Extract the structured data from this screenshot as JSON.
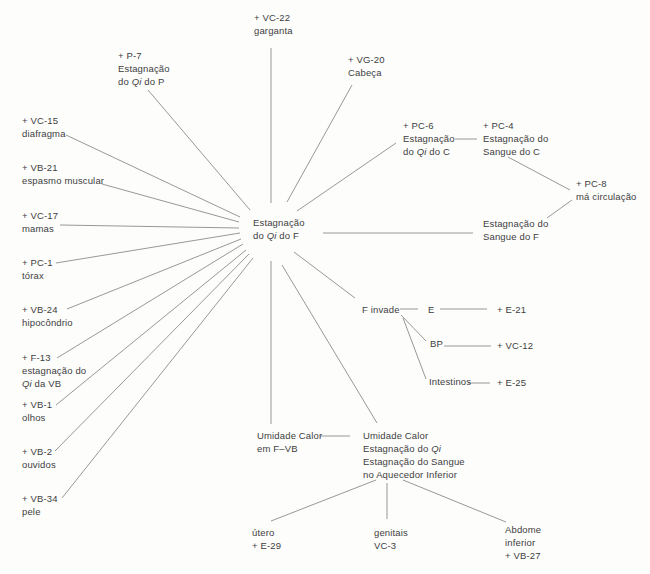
{
  "canvas": {
    "width": 650,
    "height": 574,
    "background_color": "#fdfdfc",
    "text_color": "#3e3e3e",
    "line_color": "#8c8c8c"
  },
  "nodes": [
    {
      "id": "vc22",
      "x": 254,
      "y": 12,
      "lines": [
        "+ VC-22",
        "garganta"
      ]
    },
    {
      "id": "p7",
      "x": 118,
      "y": 50,
      "lines": [
        "+ P-7",
        "Estagnação",
        "do Qi do P"
      ]
    },
    {
      "id": "vg20",
      "x": 348,
      "y": 54,
      "lines": [
        "+ VG-20",
        "Cabeça"
      ]
    },
    {
      "id": "pc6",
      "x": 403,
      "y": 120,
      "lines": [
        "+ PC-6",
        "Estagnação",
        "do Qi do C"
      ]
    },
    {
      "id": "pc4",
      "x": 483,
      "y": 120,
      "lines": [
        "+ PC-4",
        "Estagnação do",
        "Sangue do C"
      ]
    },
    {
      "id": "pc8",
      "x": 576,
      "y": 178,
      "lines": [
        "+ PC-8",
        "má circulação"
      ]
    },
    {
      "id": "sangue-f",
      "x": 483,
      "y": 218,
      "lines": [
        "Estagnação do",
        "Sangue do F"
      ]
    },
    {
      "id": "vc15",
      "x": 22,
      "y": 115,
      "lines": [
        "+ VC-15",
        "diafragma"
      ]
    },
    {
      "id": "vb21",
      "x": 22,
      "y": 162,
      "lines": [
        "+ VB-21",
        "espasmo muscular"
      ]
    },
    {
      "id": "vc17",
      "x": 22,
      "y": 210,
      "lines": [
        "+ VC-17",
        "mamas"
      ]
    },
    {
      "id": "pc1",
      "x": 22,
      "y": 257,
      "lines": [
        "+ PC-1",
        "tórax"
      ]
    },
    {
      "id": "vb24",
      "x": 22,
      "y": 304,
      "lines": [
        "+ VB-24",
        "hipocôndrio"
      ]
    },
    {
      "id": "f13",
      "x": 22,
      "y": 352,
      "lines": [
        "+ F-13",
        "estagnação do",
        "Qi da VB"
      ]
    },
    {
      "id": "vb1",
      "x": 22,
      "y": 399,
      "lines": [
        "+ VB-1",
        "olhos"
      ]
    },
    {
      "id": "vb2",
      "x": 22,
      "y": 446,
      "lines": [
        "+ VB-2",
        "ouvidos"
      ]
    },
    {
      "id": "vb34",
      "x": 22,
      "y": 493,
      "lines": [
        "+ VB-34",
        "pele"
      ]
    },
    {
      "id": "hub",
      "x": 253,
      "y": 217,
      "lines": [
        "Estagnação",
        "do Qi do F"
      ]
    },
    {
      "id": "f-invade",
      "x": 362,
      "y": 304,
      "lines": [
        "F invade"
      ]
    },
    {
      "id": "e",
      "x": 428,
      "y": 304,
      "lines": [
        "E"
      ]
    },
    {
      "id": "e21",
      "x": 497,
      "y": 304,
      "lines": [
        "+ E-21"
      ]
    },
    {
      "id": "bp",
      "x": 430,
      "y": 338,
      "lines": [
        "BP"
      ]
    },
    {
      "id": "vc12",
      "x": 497,
      "y": 340,
      "lines": [
        "+ VC-12"
      ]
    },
    {
      "id": "intestinos",
      "x": 429,
      "y": 376,
      "lines": [
        "Intestinos"
      ]
    },
    {
      "id": "e25",
      "x": 497,
      "y": 377,
      "lines": [
        "+ E-25"
      ]
    },
    {
      "id": "umidade-fvb",
      "x": 257,
      "y": 430,
      "lines": [
        "Umidade Calor",
        "em F–VB"
      ]
    },
    {
      "id": "umidade-inferior",
      "x": 363,
      "y": 430,
      "lines": [
        "Umidade Calor",
        "Estagnação do Qi",
        "Estagnação do Sangue",
        "no Aquecedor Inferior"
      ]
    },
    {
      "id": "utero",
      "x": 252,
      "y": 527,
      "lines": [
        "útero",
        "+ E-29"
      ]
    },
    {
      "id": "genitais",
      "x": 374,
      "y": 527,
      "lines": [
        "genitais",
        "VC-3"
      ]
    },
    {
      "id": "abdome",
      "x": 505,
      "y": 524,
      "lines": [
        "Abdome",
        "inferior",
        "+ VB-27"
      ]
    }
  ],
  "edges": [
    {
      "from": "vc15",
      "to": "hub",
      "x1": 66,
      "y1": 135,
      "x2": 240,
      "y2": 217
    },
    {
      "from": "vb21",
      "to": "hub",
      "x1": 102,
      "y1": 184,
      "x2": 239,
      "y2": 222
    },
    {
      "from": "vc17",
      "to": "hub",
      "x1": 60,
      "y1": 225,
      "x2": 239,
      "y2": 228
    },
    {
      "from": "pc1",
      "to": "hub",
      "x1": 56,
      "y1": 263,
      "x2": 240,
      "y2": 233
    },
    {
      "from": "vb24",
      "to": "hub",
      "x1": 67,
      "y1": 309,
      "x2": 241,
      "y2": 239
    },
    {
      "from": "f13",
      "to": "hub",
      "x1": 57,
      "y1": 358,
      "x2": 243,
      "y2": 244
    },
    {
      "from": "vb1",
      "to": "hub",
      "x1": 56,
      "y1": 405,
      "x2": 246,
      "y2": 250
    },
    {
      "from": "vb2",
      "to": "hub",
      "x1": 55,
      "y1": 451,
      "x2": 249,
      "y2": 254
    },
    {
      "from": "vb34",
      "to": "hub",
      "x1": 62,
      "y1": 498,
      "x2": 253,
      "y2": 258
    },
    {
      "from": "p7",
      "to": "hub",
      "x1": 148,
      "y1": 90,
      "x2": 250,
      "y2": 210
    },
    {
      "from": "vc22",
      "to": "hub",
      "x1": 271,
      "y1": 48,
      "x2": 271,
      "y2": 203
    },
    {
      "from": "vg20",
      "to": "hub",
      "x1": 352,
      "y1": 85,
      "x2": 287,
      "y2": 202
    },
    {
      "from": "pc6",
      "to": "hub",
      "x1": 396,
      "y1": 143,
      "x2": 297,
      "y2": 211
    },
    {
      "from": "hub",
      "to": "sangue-f",
      "x1": 323,
      "y1": 233,
      "x2": 473,
      "y2": 233
    },
    {
      "from": "hub",
      "to": "f-invade",
      "x1": 294,
      "y1": 252,
      "x2": 355,
      "y2": 298
    },
    {
      "from": "hub",
      "to": "umidade-fvb",
      "x1": 271,
      "y1": 261,
      "x2": 271,
      "y2": 424
    },
    {
      "from": "hub",
      "to": "umidade-inferior",
      "x1": 282,
      "y1": 265,
      "x2": 377,
      "y2": 423
    },
    {
      "from": "pc6",
      "to": "pc4",
      "x1": 455,
      "y1": 139,
      "x2": 477,
      "y2": 139
    },
    {
      "from": "pc4",
      "to": "pc8",
      "x1": 508,
      "y1": 157,
      "x2": 570,
      "y2": 190
    },
    {
      "from": "pc8",
      "to": "sangue-f",
      "x1": 572,
      "y1": 200,
      "x2": 547,
      "y2": 218
    },
    {
      "from": "f-invade",
      "to": "e",
      "x1": 400,
      "y1": 309,
      "x2": 418,
      "y2": 309
    },
    {
      "from": "e",
      "to": "e21",
      "x1": 440,
      "y1": 309,
      "x2": 487,
      "y2": 309
    },
    {
      "from": "f-invade",
      "to": "bp",
      "x1": 401,
      "y1": 315,
      "x2": 426,
      "y2": 341
    },
    {
      "from": "bp",
      "to": "vc12",
      "x1": 444,
      "y1": 346,
      "x2": 491,
      "y2": 346
    },
    {
      "from": "f-invade",
      "to": "intestinos",
      "x1": 403,
      "y1": 318,
      "x2": 426,
      "y2": 379
    },
    {
      "from": "intestinos",
      "to": "e25",
      "x1": 468,
      "y1": 383,
      "x2": 490,
      "y2": 383
    },
    {
      "from": "umidade-fvb",
      "to": "umidade-inferior",
      "x1": 320,
      "y1": 436,
      "x2": 350,
      "y2": 436
    },
    {
      "from": "umidade-inferior",
      "to": "utero",
      "x1": 376,
      "y1": 480,
      "x2": 271,
      "y2": 521
    },
    {
      "from": "umidade-inferior",
      "to": "genitais",
      "x1": 387,
      "y1": 483,
      "x2": 387,
      "y2": 519
    },
    {
      "from": "umidade-inferior",
      "to": "abdome",
      "x1": 403,
      "y1": 480,
      "x2": 506,
      "y2": 522
    }
  ]
}
